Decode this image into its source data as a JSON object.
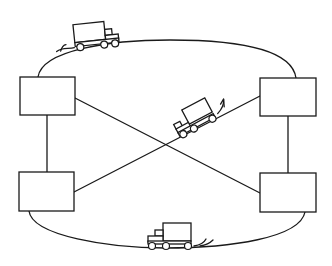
{
  "diagram": {
    "colors": {
      "stroke": "#1a1a1a",
      "background": "#ffffff"
    },
    "nodes": [
      {
        "id": "node-top-left",
        "x": 20,
        "y": 77,
        "w": 55,
        "h": 38,
        "label": ""
      },
      {
        "id": "node-bottom-left",
        "x": 19,
        "y": 172,
        "w": 55,
        "h": 39,
        "label": ""
      },
      {
        "id": "node-top-right",
        "x": 260,
        "y": 78,
        "w": 56,
        "h": 38,
        "label": ""
      },
      {
        "id": "node-bottom-right",
        "x": 260,
        "y": 173,
        "w": 56,
        "h": 39,
        "label": ""
      }
    ],
    "edges": [
      {
        "id": "edge-top-arc",
        "from": "node-top-left",
        "to": "node-top-right",
        "type": "arc"
      },
      {
        "id": "edge-bottom-arc",
        "from": "node-bottom-left",
        "to": "node-bottom-right",
        "type": "arc"
      },
      {
        "id": "edge-left-vertical",
        "from": "node-top-left",
        "to": "node-bottom-left",
        "type": "line"
      },
      {
        "id": "edge-right-vertical",
        "from": "node-top-right",
        "to": "node-bottom-right",
        "type": "line"
      },
      {
        "id": "edge-diagonal-1",
        "from": "node-top-left",
        "to": "node-bottom-right",
        "type": "line"
      },
      {
        "id": "edge-diagonal-2",
        "from": "node-bottom-left",
        "to": "node-top-right",
        "type": "line"
      }
    ],
    "vehicles": [
      {
        "id": "truck-top",
        "on": "edge-top-arc",
        "direction": "right"
      },
      {
        "id": "truck-middle",
        "on": "edge-diagonal-2",
        "direction": "down-left"
      },
      {
        "id": "truck-bottom",
        "on": "edge-bottom-arc",
        "direction": "left"
      }
    ]
  }
}
